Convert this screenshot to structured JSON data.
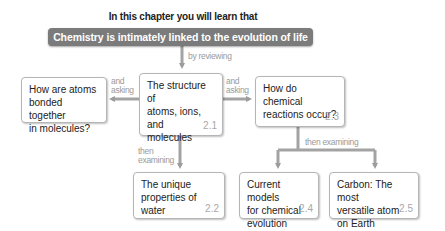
{
  "header": {
    "intro": "In this chapter you will learn that",
    "banner": "Chemistry is intimately linked to the evolution of life"
  },
  "connectors": {
    "by_reviewing": "by reviewing",
    "and_asking_left": [
      "and",
      "asking"
    ],
    "and_asking_right": [
      "and",
      "asking"
    ],
    "then_examining_left": [
      "then",
      "examining"
    ],
    "then_examining_right": "then examining"
  },
  "nodes": {
    "bonding_question": {
      "lines": [
        "How are atoms",
        "bonded together",
        "in molecules?"
      ]
    },
    "structure": {
      "lines": [
        "The structure of",
        "atoms, ions, and",
        "molecules"
      ],
      "section": "2.1"
    },
    "reactions": {
      "lines": [
        "How do chemical",
        "reactions occur?"
      ],
      "section": "2.3"
    },
    "water": {
      "lines": [
        "The unique",
        "properties of water"
      ],
      "section": "2.2"
    },
    "models": {
      "lines": [
        "Current models",
        "for chemical",
        "evolution"
      ],
      "section": "2.4"
    },
    "carbon": {
      "lines": [
        "Carbon: The most",
        "versatile atom",
        "on Earth"
      ],
      "section": "2.5"
    }
  },
  "colors": {
    "banner": "#7b7b7b",
    "arrow": "#9c9c9c",
    "section_number": "#a8a8a8"
  }
}
